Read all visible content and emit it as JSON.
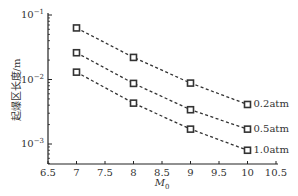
{
  "chart_data": {
    "type": "line",
    "title": "",
    "xlabel": "M0",
    "xlabel_main": "M",
    "xlabel_sub": "0",
    "ylabel": "起爆区长度/m",
    "xlim": [
      6.5,
      10.5
    ],
    "ylim": [
      0.001,
      0.1
    ],
    "yscale": "log",
    "grid": false,
    "legend_position": "inline-right",
    "x_ticks": [
      "6.5",
      "7",
      "7.5",
      "8",
      "8.5",
      "9",
      "9.5",
      "10",
      "10.5"
    ],
    "y_ticks": [
      {
        "base": "10",
        "exp": "−1",
        "value": 0.1
      },
      {
        "base": "10",
        "exp": "−2",
        "value": 0.01
      },
      {
        "base": "10",
        "exp": "−3",
        "value": 0.001
      }
    ],
    "x": [
      7,
      8,
      9,
      10
    ],
    "series": [
      {
        "name": "0.2atm",
        "values": [
          0.063,
          0.022,
          0.0088,
          0.0041
        ]
      },
      {
        "name": "0.5atm",
        "values": [
          0.026,
          0.0087,
          0.0034,
          0.0017
        ]
      },
      {
        "name": "1.0atm",
        "values": [
          0.013,
          0.0043,
          0.0017,
          0.0008
        ]
      }
    ],
    "marker": "square",
    "line_style": "dashed",
    "colors": {
      "line": "#333333",
      "marker": "#333333",
      "axis": "#222222"
    }
  }
}
